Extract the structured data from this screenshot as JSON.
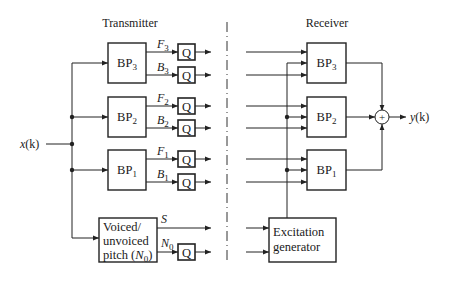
{
  "diagram": {
    "sections": {
      "transmitter": "Transmitter",
      "receiver": "Receiver"
    },
    "input": {
      "label_main": "x",
      "label_paren": "(k)"
    },
    "output": {
      "label_main": "y",
      "label_paren": "(k)"
    },
    "transmitter_filters": [
      {
        "name": "BP",
        "sub": "3",
        "f_label": "F",
        "f_sub": "3",
        "b_label": "B",
        "b_sub": "3"
      },
      {
        "name": "BP",
        "sub": "2",
        "f_label": "F",
        "f_sub": "2",
        "b_label": "B",
        "b_sub": "2"
      },
      {
        "name": "BP",
        "sub": "1",
        "f_label": "F",
        "f_sub": "1",
        "b_label": "B",
        "b_sub": "1"
      }
    ],
    "quantizer_label": "Q",
    "pitch_block": {
      "line1": "Voiced/",
      "line2": "unvoiced",
      "line3_pre": "pitch (",
      "line3_sym": "N",
      "line3_sub": "0",
      "line3_post": ")"
    },
    "pitch_outputs": {
      "s_label": "S",
      "n_label": "N",
      "n_sub": "0"
    },
    "receiver_filters": [
      {
        "name": "BP",
        "sub": "3"
      },
      {
        "name": "BP",
        "sub": "2"
      },
      {
        "name": "BP",
        "sub": "1"
      }
    ],
    "excitation_block": {
      "line1": "Excitation",
      "line2": "generator"
    },
    "summer_symbol": "+"
  }
}
